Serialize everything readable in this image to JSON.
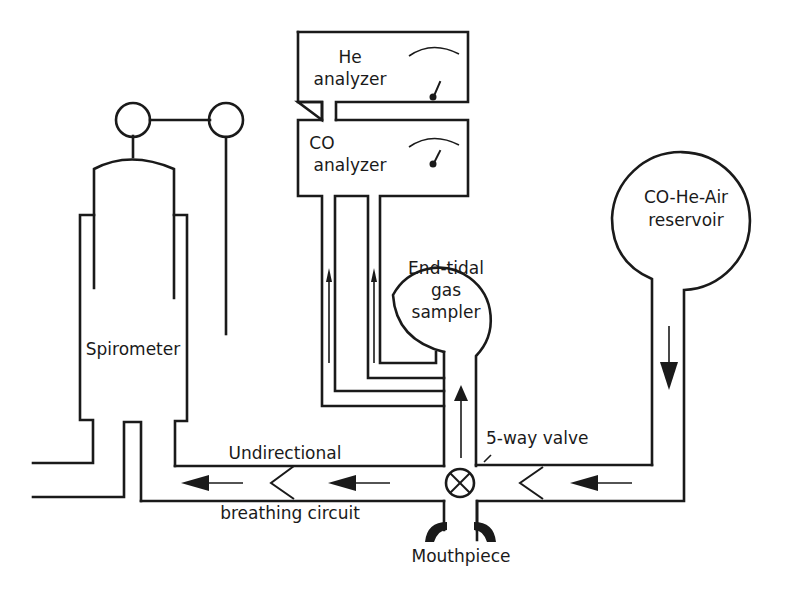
{
  "diagram": {
    "type": "apparatus-schematic",
    "components": {
      "he_analyzer": {
        "line1": "He",
        "line2": "analyzer"
      },
      "co_analyzer": {
        "line1": "CO",
        "line2": "analyzer"
      },
      "spirometer": {
        "label": "Spirometer"
      },
      "end_tidal_sampler": {
        "line1": "End-tidal",
        "line2": "gas",
        "line3": "sampler"
      },
      "reservoir": {
        "line1": "CO-He-Air",
        "line2": "reservoir"
      },
      "valve": {
        "label": "5-way valve"
      },
      "circuit": {
        "line1": "Undirectional",
        "line2": "breathing circuit"
      },
      "mouthpiece": {
        "label": "Mouthpiece"
      }
    },
    "flows": [
      {
        "from": "reservoir",
        "to": "valve",
        "direction": "down-then-left"
      },
      {
        "from": "valve",
        "to": "end_tidal_sampler",
        "direction": "up"
      },
      {
        "from": "end_tidal_sampler",
        "to": "co_analyzer",
        "direction": "up"
      },
      {
        "from": "co_analyzer",
        "to": "he_analyzer",
        "direction": "up"
      },
      {
        "from": "valve",
        "to": "spirometer",
        "direction": "left"
      }
    ],
    "colors": {
      "ink": "#1a1a1a",
      "background": "#ffffff"
    }
  }
}
